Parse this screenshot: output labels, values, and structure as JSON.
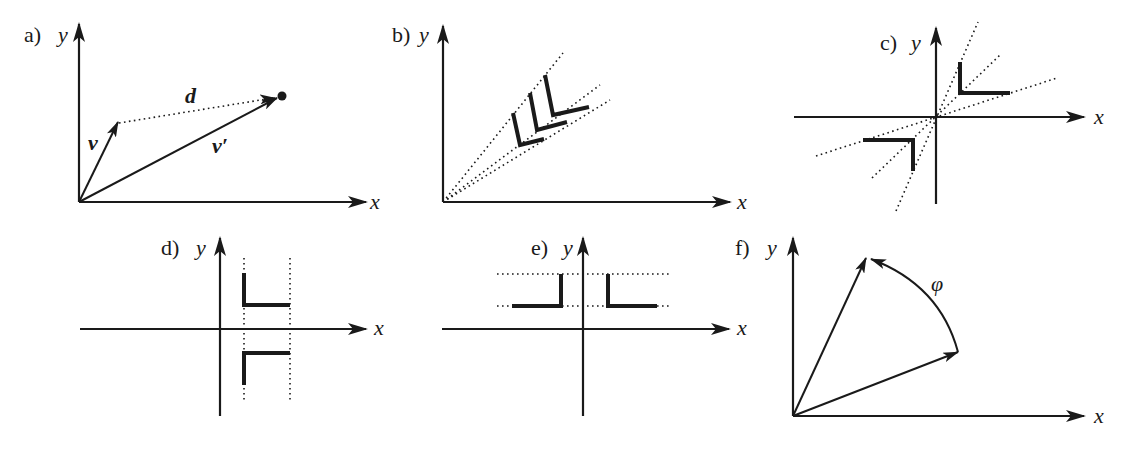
{
  "figure": {
    "colors": {
      "ink": "#1a1a1a",
      "background": "#ffffff"
    },
    "panels": [
      {
        "id": "a",
        "label": "a)",
        "x_label": "x",
        "y_label": "y",
        "vectors": [
          {
            "name": "v",
            "label": "v"
          },
          {
            "name": "v_prime",
            "label": "v′"
          },
          {
            "name": "d",
            "label": "d"
          }
        ],
        "description": "Vector v, transformed vector v′, and translation d (dotted) to a point"
      },
      {
        "id": "b",
        "label": "b)",
        "x_label": "x",
        "y_label": "y",
        "description": "Three L shapes scaled along dotted rays from the origin"
      },
      {
        "id": "c",
        "label": "c)",
        "x_label": "x",
        "y_label": "y",
        "description": "L shape reflected through the origin along dotted rays"
      },
      {
        "id": "d",
        "label": "d)",
        "x_label": "x",
        "y_label": "y",
        "description": "L shape mirrored across the x-axis between dotted vertical lines"
      },
      {
        "id": "e",
        "label": "e)",
        "x_label": "x",
        "y_label": "y",
        "description": "L shape mirrored across the y-axis between dotted horizontal lines"
      },
      {
        "id": "f",
        "label": "f)",
        "x_label": "x",
        "y_label": "y",
        "angle_label": "φ",
        "description": "Vector rotated by angle φ about the origin"
      }
    ]
  }
}
